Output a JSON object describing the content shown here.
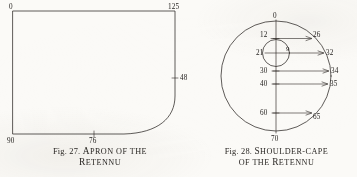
{
  "page": {
    "background_color": "#fbfaf7",
    "ink_color": "#2b2724"
  },
  "figures": [
    {
      "id": "apron",
      "caption": {
        "fig_number": "Fig. 27.",
        "title_line_1": "Apron of the",
        "title_line_2": "Retennu",
        "title_line_1_initial": "A",
        "title_line_1_rest": "PRON OF THE",
        "title_line_2_initial": "R",
        "title_line_2_rest": "ETENNU"
      },
      "measurements": [
        {
          "name": "top-left",
          "value": "0",
          "x": 10,
          "y": 10
        },
        {
          "name": "top-right",
          "value": "125",
          "x": 168,
          "y": 10
        },
        {
          "name": "right-edge",
          "value": "48",
          "x": 178,
          "y": 74
        },
        {
          "name": "bottom-left",
          "value": "90",
          "x": 10,
          "y": 142
        },
        {
          "name": "bottom-mid",
          "value": "76",
          "x": 90,
          "y": 142
        }
      ]
    },
    {
      "id": "shoulder-cape",
      "caption": {
        "fig_number": "Fig. 28.",
        "title_line_1": "Shoulder-cape",
        "title_line_2": "of the Retennu",
        "title_line_1_initial": "S",
        "title_line_1_rest": "HOULDER-CAPE",
        "title_line_2_prefix": "OF THE ",
        "title_line_2_initial": "R",
        "title_line_2_rest": "ETENNU"
      },
      "measurements": [
        {
          "name": "top-center",
          "value": "0",
          "side": "center"
        },
        {
          "name": "left-12",
          "value": "12",
          "side": "left"
        },
        {
          "name": "left-21",
          "value": "21",
          "side": "left"
        },
        {
          "name": "inner-9",
          "value": "9",
          "side": "inner"
        },
        {
          "name": "left-30",
          "value": "30",
          "side": "left"
        },
        {
          "name": "left-40",
          "value": "40",
          "side": "left"
        },
        {
          "name": "left-60",
          "value": "60",
          "side": "left"
        },
        {
          "name": "bottom-70",
          "value": "70",
          "side": "center"
        },
        {
          "name": "right-26",
          "value": "26",
          "side": "right"
        },
        {
          "name": "right-32",
          "value": "32",
          "side": "right"
        },
        {
          "name": "right-34",
          "value": "34",
          "side": "right"
        },
        {
          "name": "right-35",
          "value": "35",
          "side": "right"
        },
        {
          "name": "right-65",
          "value": "65",
          "side": "right"
        }
      ]
    }
  ]
}
